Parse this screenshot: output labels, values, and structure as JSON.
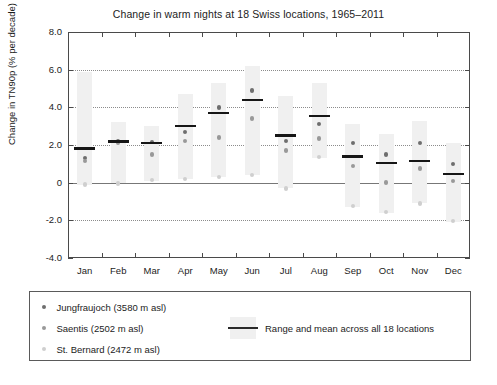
{
  "chart_data": {
    "type": "scatter",
    "title": "Change in warm nights at 18 Swiss locations, 1965–2011",
    "xlabel": "",
    "ylabel": "Change in TN90p (% per decade)",
    "categories": [
      "Jan",
      "Feb",
      "Mar",
      "Apr",
      "May",
      "Jun",
      "Jul",
      "Aug",
      "Sep",
      "Oct",
      "Nov",
      "Dec"
    ],
    "ylim": [
      -4.0,
      8.0
    ],
    "ytick_labels": [
      "8.0",
      "6.0",
      "4.0",
      "2.0",
      "0",
      "-2.0",
      "-4.0"
    ],
    "ytick_values": [
      8.0,
      6.0,
      4.0,
      2.0,
      0,
      -2.0,
      -4.0
    ],
    "grid": "horizontal dotted at 6.0, 4.0, 2.0, -2.0; solid reference line at 0",
    "legend_position": "below plot, boxed",
    "mean_label": "Range and mean across all 18 locations",
    "means": [
      1.8,
      2.2,
      2.1,
      3.0,
      3.7,
      4.4,
      2.5,
      3.55,
      1.4,
      1.05,
      1.15,
      0.45
    ],
    "range_low": [
      -0.1,
      0.0,
      0.1,
      0.2,
      0.3,
      0.4,
      -0.3,
      1.3,
      -1.3,
      -1.6,
      -1.1,
      -2.1
    ],
    "range_high": [
      5.9,
      3.2,
      3.0,
      4.7,
      5.3,
      6.2,
      4.6,
      5.3,
      3.1,
      2.6,
      3.3,
      2.1
    ],
    "series": [
      {
        "name": "Jungfraujoch (3580 m asl)",
        "color": "#6e6e6e",
        "values": [
          1.3,
          2.2,
          2.15,
          2.7,
          4.0,
          4.9,
          2.2,
          3.1,
          2.1,
          1.5,
          2.1,
          1.0
        ]
      },
      {
        "name": "Saentis (2502 m asl)",
        "color": "#999999",
        "values": [
          1.15,
          2.1,
          1.5,
          2.2,
          2.4,
          3.4,
          1.7,
          2.35,
          0.9,
          0.0,
          0.75,
          0.1
        ]
      },
      {
        "name": "St. Bernard (2472 m asl)",
        "color": "#cfcfcf",
        "values": [
          -0.1,
          -0.05,
          0.15,
          0.2,
          0.3,
          0.4,
          -0.3,
          1.35,
          -1.25,
          -1.55,
          -1.1,
          -2.05
        ]
      }
    ]
  },
  "legend": {
    "entries": [
      {
        "label": "Jungfraujoch (3580 m asl)"
      },
      {
        "label": "Saentis (2502 m asl)"
      },
      {
        "label": "St. Bernard (2472 m asl)"
      }
    ],
    "range_label": "Range and mean across all 18 locations"
  },
  "caption": ""
}
